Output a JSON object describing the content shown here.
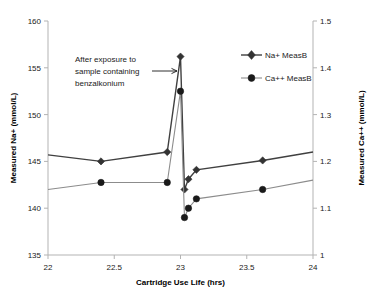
{
  "chart_data": {
    "type": "line",
    "title": "",
    "xlabel": "Cartridge Use Life (hrs)",
    "ylabel": "Measured Na+ (mmol/L)",
    "ylabel_right": "Measured Ca++ (mmol/L)",
    "xlim": [
      22,
      24
    ],
    "ylim": [
      135,
      160
    ],
    "ylim_right": [
      1,
      1.5
    ],
    "xticks": [
      "22",
      "22.5",
      "23",
      "23.5",
      "24"
    ],
    "xtick_values": [
      22,
      22.5,
      23,
      23.5,
      24
    ],
    "yticks": [
      "135",
      "140",
      "145",
      "150",
      "155",
      "160"
    ],
    "ytick_values": [
      135,
      140,
      145,
      150,
      155,
      160
    ],
    "yticks_right": [
      "1",
      "1.1",
      "1.2",
      "1.3",
      "1.4",
      "1.5"
    ],
    "ytick_values_right": [
      1,
      1.1,
      1.2,
      1.3,
      1.4,
      1.5
    ],
    "grid": false,
    "legend_position": "top-right",
    "series": [
      {
        "name": "Na+ MeasB",
        "axis": "left",
        "marker": "diamond",
        "color": "#404040",
        "x": [
          22.0,
          22.4,
          22.9,
          23.0,
          23.03,
          23.06,
          23.12,
          23.62,
          24.0
        ],
        "values": [
          145.7,
          145.0,
          146.0,
          156.2,
          142.0,
          143.1,
          144.1,
          145.1,
          146.0
        ]
      },
      {
        "name": "Ca++ MeasB",
        "axis": "right",
        "marker": "circle",
        "color": "#8c8c8c",
        "x": [
          22.0,
          22.4,
          22.9,
          23.0,
          23.03,
          23.06,
          23.12,
          23.62,
          24.0
        ],
        "values": [
          1.14,
          1.155,
          1.155,
          1.35,
          1.08,
          1.1,
          1.12,
          1.14,
          1.16
        ]
      }
    ],
    "annotations": [
      {
        "name": "benzalkonium-annotation",
        "lines": [
          "After exposure to",
          "sample containing",
          "benzalkonium"
        ],
        "arrow_from_x": 22.78,
        "arrow_from_y": 154.6,
        "arrow_to_x": 22.96,
        "arrow_to_y": 154.6
      }
    ]
  }
}
